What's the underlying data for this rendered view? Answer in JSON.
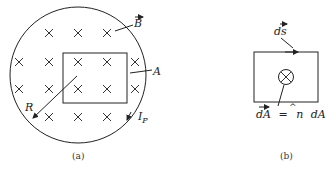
{
  "figure_a": {
    "caption": "(a)",
    "labels": {
      "field": "B",
      "area": "A",
      "radius": "R",
      "current": "I",
      "current_sub": "P"
    },
    "field_direction": "into-page",
    "x_marks": [
      [
        49,
        33
      ],
      [
        78,
        33
      ],
      [
        107,
        33
      ],
      [
        19,
        62
      ],
      [
        49,
        62
      ],
      [
        78,
        62
      ],
      [
        107,
        62
      ],
      [
        135,
        62
      ],
      [
        19,
        89
      ],
      [
        49,
        89
      ],
      [
        78,
        89
      ],
      [
        107,
        89
      ],
      [
        135,
        89
      ],
      [
        49,
        117
      ],
      [
        78,
        117
      ],
      [
        107,
        117
      ]
    ]
  },
  "figure_b": {
    "caption": "(b)",
    "labels": {
      "line_element": "ds",
      "area_element_lhs": "dA",
      "equals": "=",
      "unit_normal": "n",
      "area_element_rhs": "dA"
    },
    "normal_direction": "into-page"
  }
}
